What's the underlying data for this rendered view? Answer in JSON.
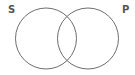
{
  "diagram": {
    "type": "venn",
    "sets": [
      {
        "label": "S",
        "cx": 46,
        "cy": 38.5,
        "r": 30.5
      },
      {
        "label": "P",
        "cx": 88,
        "cy": 38.5,
        "r": 30.5
      }
    ],
    "stroke_color": "#6e6e6e",
    "label_color": "#555555"
  }
}
